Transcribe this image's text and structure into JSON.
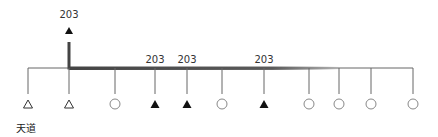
{
  "diagram": {
    "caption": "天道",
    "baseline_y": 68,
    "line_start_x": 28,
    "line_end_x": 413,
    "thick_segment": {
      "from_x": 69,
      "to_x": 340
    },
    "riser": {
      "x": 69,
      "top_y": 42,
      "label": "203"
    },
    "ticks": [
      {
        "x": 28,
        "symbol": "triangle-open",
        "label": ""
      },
      {
        "x": 69,
        "symbol": "triangle-open",
        "label": ""
      },
      {
        "x": 115,
        "symbol": "circle-open",
        "label": ""
      },
      {
        "x": 155,
        "symbol": "triangle-filled",
        "label": "203"
      },
      {
        "x": 187,
        "symbol": "triangle-filled",
        "label": "203"
      },
      {
        "x": 222,
        "symbol": "circle-open",
        "label": ""
      },
      {
        "x": 264,
        "symbol": "triangle-filled",
        "label": "203"
      },
      {
        "x": 309,
        "symbol": "circle-open",
        "label": ""
      },
      {
        "x": 339,
        "symbol": "circle-open",
        "label": ""
      },
      {
        "x": 371,
        "symbol": "circle-open",
        "label": ""
      },
      {
        "x": 413,
        "symbol": "circle-open",
        "label": ""
      }
    ],
    "top_marker": {
      "x": 69,
      "symbol": "triangle-filled",
      "label": "203"
    },
    "colors": {
      "line": "#666666",
      "thick": "#444444",
      "symbol": "#111111",
      "open_symbol": "#888888"
    }
  }
}
